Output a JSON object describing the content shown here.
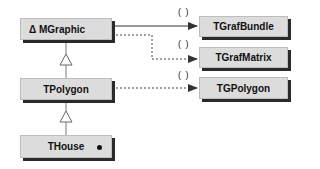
{
  "diagram": {
    "classes": [
      {
        "id": "mgraphic",
        "label": "Δ MGraphic",
        "abstract": true
      },
      {
        "id": "tpolygon",
        "label": "TPolygon"
      },
      {
        "id": "thouse",
        "label": "THouse",
        "marker": "dot"
      },
      {
        "id": "tgrafbundle",
        "label": "TGrafBundle"
      },
      {
        "id": "tgrafmatrix",
        "label": "TGrafMatrix"
      },
      {
        "id": "tgpolygon",
        "label": "TGPolygon"
      }
    ],
    "relations": [
      {
        "from": "tpolygon",
        "to": "mgraphic",
        "type": "inheritance"
      },
      {
        "from": "thouse",
        "to": "tpolygon",
        "type": "inheritance"
      },
      {
        "from": "mgraphic",
        "to": "tgrafbundle",
        "type": "has-a",
        "style": "solid",
        "label": "( )"
      },
      {
        "from": "mgraphic",
        "to": "tgrafmatrix",
        "type": "uses",
        "style": "dashed",
        "label": "( )"
      },
      {
        "from": "tpolygon",
        "to": "tgpolygon",
        "type": "uses",
        "style": "dashed",
        "label": "( )"
      }
    ],
    "paren_label": "( )"
  }
}
